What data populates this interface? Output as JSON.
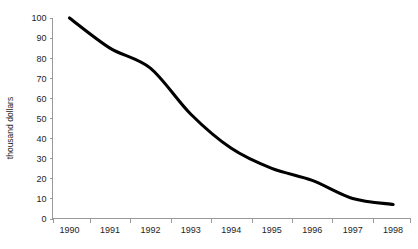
{
  "chart_data": {
    "type": "line",
    "title": "",
    "subtitle": "",
    "xlabel": "",
    "ylabel": "thousand dollars",
    "categories": [
      "1990",
      "1991",
      "1992",
      "1993",
      "1994",
      "1995",
      "1996",
      "1997",
      "1998"
    ],
    "x": [
      1990,
      1991,
      1992,
      1993,
      1994,
      1995,
      1996,
      1997,
      1998
    ],
    "values": [
      100,
      85,
      75,
      52,
      35,
      25,
      19,
      10,
      7
    ],
    "series": [
      {
        "name": "",
        "values": [
          100,
          85,
          75,
          52,
          35,
          25,
          19,
          10,
          7
        ],
        "color": "#000000"
      }
    ],
    "ylim": [
      0,
      100
    ],
    "y_ticks": [
      0,
      10,
      20,
      30,
      40,
      50,
      60,
      70,
      80,
      90,
      100
    ],
    "y_tick_labels": [
      "0",
      "10",
      "20",
      "30",
      "40",
      "50",
      "60",
      "70",
      "80",
      "90",
      "100"
    ],
    "x_tick_labels": [
      "1990",
      "1991",
      "1992",
      "1993",
      "1994",
      "1995",
      "1996",
      "1997",
      "1998"
    ],
    "grid": false,
    "legend": false,
    "legend_position": "none",
    "line_color": "#000000",
    "axis_color": "#9a9a9a",
    "background_color": "#ffffff"
  },
  "caption": {
    "text": ""
  }
}
